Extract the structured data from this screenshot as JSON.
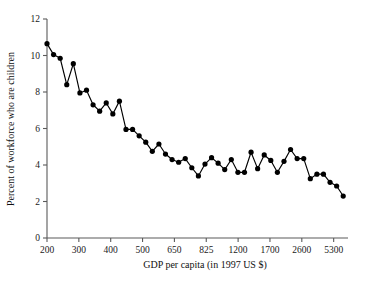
{
  "chart_data": {
    "type": "line",
    "title": "",
    "subtitle": "",
    "xlabel": "GDP per capita (in 1997 US $)",
    "ylabel": "Percent of workforce who are children",
    "x_tick_labels": [
      "200",
      "300",
      "400",
      "500",
      "650",
      "825",
      "1200",
      "1700",
      "2600",
      "5300"
    ],
    "y_tick_labels": [
      "0",
      "2",
      "4",
      "6",
      "8",
      "10",
      "12"
    ],
    "y_ticks": [
      0,
      2,
      4,
      6,
      8,
      10,
      12
    ],
    "ylim": [
      0,
      12
    ],
    "x_scale": "log-like ordered ranks",
    "grid": false,
    "legend": null,
    "markers": "filled-circle",
    "series": [
      {
        "name": "Percent of workforce who are children",
        "values": [
          10.65,
          10.05,
          9.85,
          8.4,
          9.55,
          7.95,
          8.1,
          7.3,
          6.95,
          7.4,
          6.8,
          7.5,
          5.95,
          5.95,
          5.6,
          5.25,
          4.75,
          5.15,
          4.6,
          4.3,
          4.15,
          4.35,
          3.85,
          3.4,
          4.05,
          4.4,
          4.1,
          3.75,
          4.3,
          3.6,
          3.6,
          4.7,
          3.8,
          4.55,
          4.25,
          3.6,
          4.2,
          4.85,
          4.35,
          4.35,
          3.25,
          3.5,
          3.5,
          3.05,
          2.85,
          2.3
        ]
      }
    ],
    "n_points": 46,
    "x_axis_note": "ticks evenly spaced at GDP values 200, 300, 400, 500, 650, 825, 1200, 1700, 2600, 5300"
  }
}
